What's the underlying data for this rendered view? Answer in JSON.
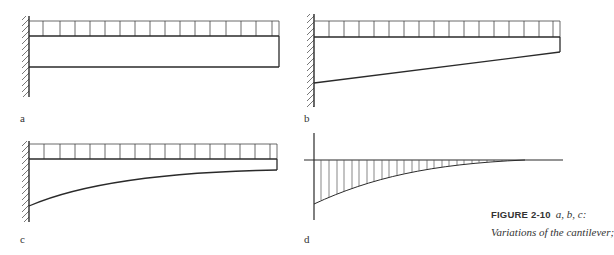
{
  "figure": {
    "number_label": "FIGURE 2-10",
    "subtitle": "a, b, c:",
    "caption_line2": "Variations of the cantilever;"
  },
  "panels": [
    {
      "id": "a",
      "label": "a",
      "description": "Cantilever with uniform load, constant depth beam"
    },
    {
      "id": "b",
      "label": "b",
      "description": "Cantilever with uniform load, linearly tapered beam"
    },
    {
      "id": "c",
      "label": "c",
      "description": "Cantilever with uniform load, curved (parabolic) tapered beam"
    },
    {
      "id": "d",
      "label": "d",
      "description": "Bending moment diagram with vertical hatching"
    }
  ],
  "colors": {
    "line": "#2a2a2a",
    "hatch": "#555555",
    "text": "#333333"
  }
}
